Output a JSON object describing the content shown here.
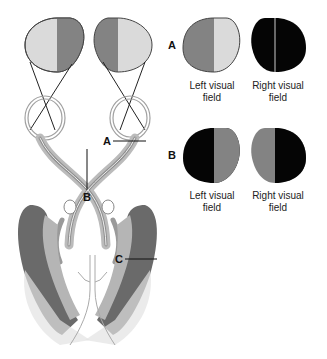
{
  "colors": {
    "light": "#dadada",
    "mid": "#838383",
    "black": "#050505",
    "outline": "#444444",
    "tract": "#9a9a9a",
    "radiation": "#6a6a6a"
  },
  "diagram": {
    "labels": {
      "a": "A",
      "b": "B",
      "c": "C"
    },
    "panel_a": {
      "letter": "A",
      "left_caption_line1": "Left visual",
      "left_caption_line2": "field",
      "right_caption_line1": "Right visual",
      "right_caption_line2": "field"
    },
    "panel_b": {
      "letter": "B",
      "left_caption_line1": "Left visual",
      "left_caption_line2": "field",
      "right_caption_line1": "Right visual",
      "right_caption_line2": "field"
    }
  }
}
